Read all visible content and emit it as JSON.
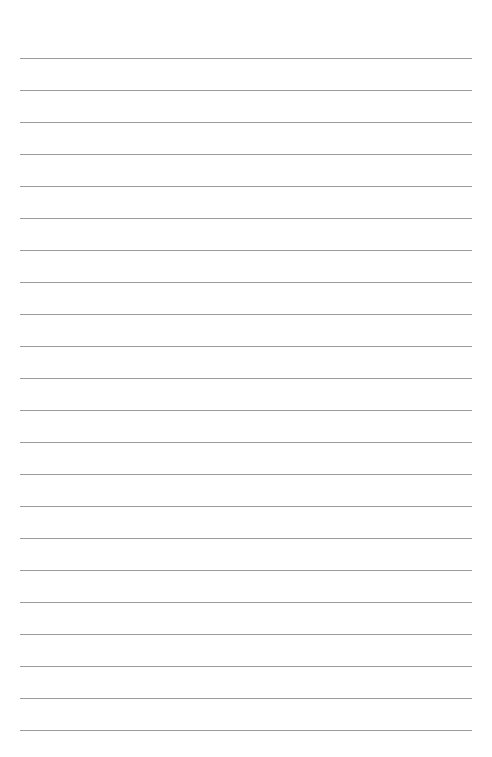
{
  "page": {
    "type": "lined-paper",
    "line_count": 22,
    "first_line_y": 58,
    "line_spacing": 32,
    "line_color": "#9a9a9a",
    "footer_text": ""
  }
}
